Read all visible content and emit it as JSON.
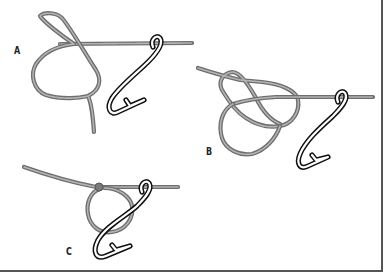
{
  "figure": {
    "panels": [
      {
        "id": "A",
        "label": "A",
        "step": 1
      },
      {
        "id": "B",
        "label": "B",
        "step": 2
      },
      {
        "id": "C",
        "label": "C",
        "step": 3
      }
    ],
    "colors": {
      "line": "#6e6e6e",
      "line_highlight": "#b4b4b4",
      "hook": "#111111",
      "border": "#555555",
      "background": "#ffffff"
    }
  }
}
